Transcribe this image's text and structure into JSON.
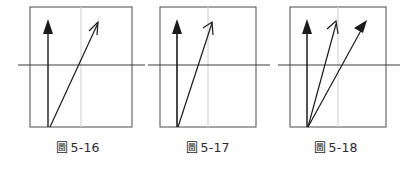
{
  "page": {
    "background_color": "#ffffff",
    "figure_count": 3
  },
  "style": {
    "box_stroke_color": "#4a4a4a",
    "axis_stroke_color": "#3a3a3a",
    "gridline_color": "#d8d6d2",
    "arrow_color": "#1a1a1a"
  },
  "figures": [
    {
      "id": "fig-5-16",
      "caption_label": "圖",
      "caption_number": "5-16",
      "caption_full": "圖 5-16",
      "box": {
        "x": 20,
        "y": 7,
        "width": 102,
        "height": 120
      },
      "axis_line": {
        "x1": 8,
        "y1": 65,
        "x2": 135,
        "y2": 65
      },
      "gridline": {
        "x": 71,
        "y1": 7,
        "y2": 127
      },
      "arrows": [
        {
          "name": "vertical-arrow",
          "head_style": "filled",
          "x1": 38,
          "y1": 127,
          "x2": 38,
          "y2": 20
        },
        {
          "name": "diagonal-arrow",
          "head_style": "open",
          "x1": 40,
          "y1": 127,
          "x2": 88,
          "y2": 22
        }
      ]
    },
    {
      "id": "fig-5-17",
      "caption_label": "圖",
      "caption_number": "5-17",
      "caption_full": "圖 5-17",
      "box": {
        "x": 20,
        "y": 7,
        "width": 96,
        "height": 120
      },
      "axis_line": {
        "x1": 8,
        "y1": 65,
        "x2": 130,
        "y2": 65
      },
      "gridline": {
        "x": 68,
        "y1": 7,
        "y2": 127
      },
      "arrows": [
        {
          "name": "vertical-arrow",
          "head_style": "filled",
          "x1": 37,
          "y1": 127,
          "x2": 37,
          "y2": 20
        },
        {
          "name": "diagonal-arrow",
          "head_style": "open",
          "x1": 38,
          "y1": 127,
          "x2": 72,
          "y2": 22
        }
      ]
    },
    {
      "id": "fig-5-18",
      "caption_label": "圖",
      "caption_number": "5-18",
      "caption_full": "圖 5-18",
      "box": {
        "x": 22,
        "y": 7,
        "width": 96,
        "height": 120
      },
      "axis_line": {
        "x1": 10,
        "y1": 65,
        "x2": 132,
        "y2": 65
      },
      "gridline": {
        "x": 70,
        "y1": 7,
        "y2": 127
      },
      "arrows": [
        {
          "name": "vertical-arrow",
          "head_style": "filled",
          "x1": 39,
          "y1": 127,
          "x2": 39,
          "y2": 20
        },
        {
          "name": "diagonal-arrow-inner",
          "head_style": "open",
          "x1": 40,
          "y1": 127,
          "x2": 68,
          "y2": 22
        },
        {
          "name": "diagonal-arrow-outer",
          "head_style": "filled",
          "x1": 40,
          "y1": 127,
          "x2": 98,
          "y2": 22
        }
      ]
    }
  ]
}
